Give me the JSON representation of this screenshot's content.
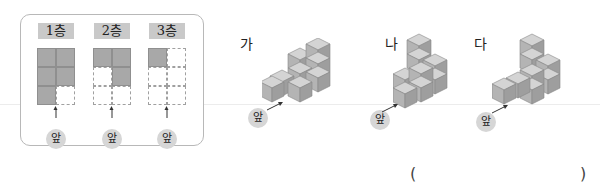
{
  "plan": {
    "floors": [
      {
        "label": "1층",
        "cells": [
          [
            1,
            1
          ],
          [
            1,
            1
          ],
          [
            1,
            0
          ]
        ],
        "front_label": "앞"
      },
      {
        "label": "2층",
        "cells": [
          [
            1,
            1
          ],
          [
            0,
            1
          ],
          [
            0,
            0
          ]
        ],
        "front_label": "앞"
      },
      {
        "label": "3층",
        "cells": [
          [
            1,
            0
          ],
          [
            0,
            0
          ],
          [
            0,
            0
          ]
        ],
        "front_label": "앞"
      }
    ]
  },
  "options": [
    {
      "label": "가",
      "front_label": "앞"
    },
    {
      "label": "나",
      "front_label": "앞"
    },
    {
      "label": "다",
      "front_label": "앞"
    }
  ],
  "answer": {
    "open_paren": "(",
    "close_paren": ")",
    "value": ""
  },
  "colors": {
    "filled_cell": "#a8a8a8",
    "cube_top": "#d4d4d4",
    "cube_left": "#b4b4b4",
    "cube_right": "#9c9c9c",
    "badge": "#d6d6d6"
  }
}
